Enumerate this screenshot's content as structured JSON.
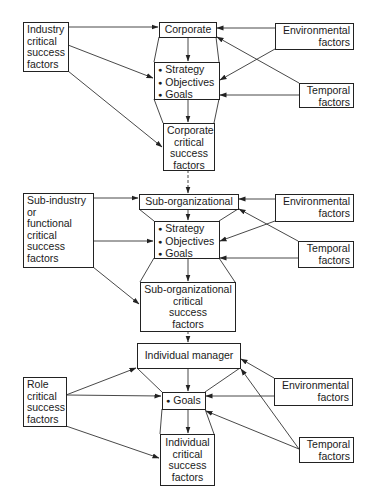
{
  "diagram": {
    "tiers": [
      {
        "name": "corporate",
        "level": {
          "label": "Corporate"
        },
        "source": {
          "lines": [
            "Industry",
            "critical",
            "success",
            "factors"
          ]
        },
        "environmental": {
          "lines": [
            "Environmental",
            "factors"
          ]
        },
        "temporal": {
          "lines": [
            "Temporal",
            "factors"
          ]
        },
        "planning": {
          "items": [
            "Strategy",
            "Objectives",
            "Goals"
          ]
        },
        "csf": {
          "lines": [
            "Corporate",
            "critical",
            "success",
            "factors"
          ]
        }
      },
      {
        "name": "sub-organizational",
        "level": {
          "label": "Sub-organizational"
        },
        "source": {
          "lines": [
            "Sub-industry",
            "or",
            "functional",
            "critical",
            "success",
            "factors"
          ]
        },
        "environmental": {
          "lines": [
            "Environmental",
            "factors"
          ]
        },
        "temporal": {
          "lines": [
            "Temporal",
            "factors"
          ]
        },
        "planning": {
          "items": [
            "Strategy",
            "Objectives",
            "Goals"
          ]
        },
        "csf": {
          "lines": [
            "Sub-organizational",
            "critical",
            "success",
            "factors"
          ]
        }
      },
      {
        "name": "individual",
        "level": {
          "label": "Individual manager"
        },
        "source": {
          "lines": [
            "Role",
            "critical",
            "success",
            "factors"
          ]
        },
        "environmental": {
          "lines": [
            "Environmental",
            "factors"
          ]
        },
        "temporal": {
          "lines": [
            "Temporal",
            "factors"
          ]
        },
        "planning": {
          "items": [
            "Goals"
          ]
        },
        "csf": {
          "lines": [
            "Individual",
            "critical",
            "success",
            "factors"
          ]
        }
      }
    ],
    "colors": {
      "line": "#222222",
      "background": "#ffffff"
    }
  }
}
